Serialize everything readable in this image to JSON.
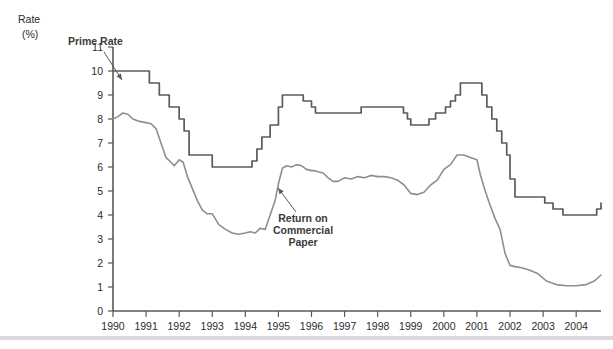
{
  "chart_data": {
    "type": "line",
    "title": "",
    "subtitle": "",
    "xlabel": "",
    "ylabel": "Rate (%)",
    "ylabel_line1": "Rate",
    "ylabel_line2": "(%)",
    "xlim": [
      1990,
      2004.75
    ],
    "ylim": [
      0,
      11
    ],
    "grid": false,
    "legend_position": "inline-annotations",
    "y_ticks": [
      0,
      1,
      2,
      3,
      4,
      5,
      6,
      7,
      8,
      9,
      10,
      11
    ],
    "y_tick_labels": [
      "0",
      "1",
      "2",
      "3",
      "4",
      "5",
      "6",
      "7",
      "8",
      "9",
      "10",
      "11"
    ],
    "x_ticks": [
      1990,
      1991,
      1992,
      1993,
      1994,
      1995,
      1996,
      1997,
      1998,
      1999,
      2000,
      2001,
      2002,
      2003,
      2004
    ],
    "x_tick_labels": [
      "1990",
      "1991",
      "1992",
      "1993",
      "1994",
      "1995",
      "1996",
      "1997",
      "1998",
      "1999",
      "2000",
      "2001",
      "2002",
      "2003",
      "2004"
    ],
    "series": [
      {
        "name": "Prime Rate",
        "color": "#5b5b5d",
        "style": "stepped",
        "x": [
          1990.0,
          1990.9,
          1991.0,
          1991.1,
          1991.25,
          1991.4,
          1991.55,
          1991.7,
          1991.85,
          1992.0,
          1992.15,
          1992.3,
          1992.55,
          1993.0,
          1993.5,
          1994.0,
          1994.2,
          1994.35,
          1994.5,
          1994.62,
          1994.75,
          1994.88,
          1995.0,
          1995.12,
          1995.3,
          1995.55,
          1995.75,
          1996.0,
          1996.12,
          1996.3,
          1996.6,
          1997.0,
          1997.25,
          1997.5,
          1998.0,
          1998.6,
          1998.78,
          1998.9,
          1999.0,
          1999.4,
          1999.55,
          1999.75,
          1999.9,
          2000.05,
          2000.2,
          2000.35,
          2000.5,
          2000.75,
          2001.0,
          2001.05,
          2001.15,
          2001.3,
          2001.45,
          2001.6,
          2001.75,
          2001.9,
          2002.0,
          2002.15,
          2002.6,
          2002.9,
          2003.05,
          2003.3,
          2003.6,
          2004.0,
          2004.4,
          2004.62,
          2004.75
        ],
        "y": [
          10.0,
          10.0,
          10.0,
          9.5,
          9.5,
          9.0,
          9.0,
          8.5,
          8.5,
          8.0,
          7.5,
          6.5,
          6.5,
          6.0,
          6.0,
          6.0,
          6.25,
          6.75,
          7.25,
          7.25,
          7.75,
          7.75,
          8.5,
          9.0,
          9.0,
          9.0,
          8.75,
          8.5,
          8.25,
          8.25,
          8.25,
          8.25,
          8.25,
          8.5,
          8.5,
          8.5,
          8.25,
          8.0,
          7.75,
          7.75,
          8.0,
          8.25,
          8.25,
          8.5,
          8.75,
          9.0,
          9.5,
          9.5,
          9.5,
          9.5,
          9.0,
          8.5,
          8.0,
          7.5,
          7.0,
          6.5,
          5.5,
          4.75,
          4.75,
          4.75,
          4.5,
          4.25,
          4.0,
          4.0,
          4.0,
          4.25,
          4.5
        ]
      },
      {
        "name": "Return on Commercial Paper",
        "color": "#8e8e90",
        "style": "smooth",
        "x": [
          1990.0,
          1990.15,
          1990.3,
          1990.45,
          1990.6,
          1990.8,
          1991.0,
          1991.15,
          1991.3,
          1991.45,
          1991.6,
          1991.75,
          1991.85,
          1992.0,
          1992.12,
          1992.25,
          1992.4,
          1992.55,
          1992.7,
          1992.85,
          1993.0,
          1993.2,
          1993.4,
          1993.6,
          1993.8,
          1994.0,
          1994.15,
          1994.3,
          1994.45,
          1994.6,
          1994.75,
          1994.9,
          1995.0,
          1995.12,
          1995.25,
          1995.4,
          1995.55,
          1995.7,
          1995.85,
          1996.0,
          1996.08,
          1996.2,
          1996.35,
          1996.5,
          1996.65,
          1996.8,
          1997.0,
          1997.2,
          1997.4,
          1997.6,
          1997.8,
          1998.0,
          1998.2,
          1998.4,
          1998.6,
          1998.8,
          1999.0,
          1999.2,
          1999.4,
          1999.6,
          1999.8,
          2000.0,
          2000.2,
          2000.4,
          2000.6,
          2000.8,
          2001.0,
          2001.1,
          2001.25,
          2001.4,
          2001.55,
          2001.7,
          2001.85,
          2002.0,
          2002.15,
          2002.35,
          2002.6,
          2002.85,
          2003.1,
          2003.4,
          2003.7,
          2004.0,
          2004.3,
          2004.55,
          2004.75
        ],
        "y": [
          8.0,
          8.1,
          8.25,
          8.2,
          8.0,
          7.9,
          7.85,
          7.8,
          7.6,
          7.0,
          6.4,
          6.2,
          6.05,
          6.3,
          6.2,
          5.6,
          5.1,
          4.6,
          4.2,
          4.05,
          4.05,
          3.6,
          3.4,
          3.25,
          3.2,
          3.25,
          3.3,
          3.25,
          3.45,
          3.4,
          4.0,
          4.6,
          5.3,
          5.95,
          6.05,
          6.0,
          6.1,
          6.05,
          5.9,
          5.85,
          5.85,
          5.8,
          5.75,
          5.55,
          5.4,
          5.4,
          5.55,
          5.5,
          5.6,
          5.55,
          5.65,
          5.6,
          5.6,
          5.55,
          5.45,
          5.25,
          4.9,
          4.85,
          4.95,
          5.25,
          5.45,
          5.9,
          6.1,
          6.5,
          6.5,
          6.4,
          6.3,
          5.7,
          5.0,
          4.4,
          3.85,
          3.4,
          2.4,
          1.9,
          1.85,
          1.8,
          1.7,
          1.55,
          1.25,
          1.1,
          1.05,
          1.05,
          1.1,
          1.25,
          1.5
        ]
      }
    ],
    "annotations": [
      {
        "name": "prime-rate-annotation",
        "text": "Prime Rate",
        "lines": [
          "Prime Rate"
        ],
        "text_x": 68,
        "text_y": 45,
        "align": "start",
        "arrow_from_x": 104,
        "arrow_from_y": 52,
        "arrow_to_x": 122,
        "arrow_to_y": 80
      },
      {
        "name": "commercial-paper-annotation",
        "text": "Return on Commercial Paper",
        "lines": [
          "Return on",
          "Commercial",
          "Paper"
        ],
        "text_x": 303,
        "text_y": 222,
        "align": "middle",
        "line_height": 12,
        "arrow_from_x": 296,
        "arrow_from_y": 212,
        "arrow_to_x": 278,
        "arrow_to_y": 188
      }
    ]
  }
}
